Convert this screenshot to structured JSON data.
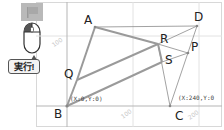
{
  "controls": {
    "flag_icon": "flag-icon",
    "mouse_icon": "mouse-icon",
    "run_label": "実行!"
  },
  "axes": {
    "origin_label": "(X:0,Y:0)",
    "c_label": "(X:240,Y:0",
    "tick_100_y": "100",
    "tick_100_x": "100",
    "tick_200_x": "200"
  },
  "points": {
    "A": "A",
    "B": "B",
    "C": "C",
    "D": "D",
    "P": "P",
    "Q": "Q",
    "R": "R",
    "S": "S"
  },
  "colors": {
    "thick_line": "#9a9a9a",
    "thin_line": "#8a8a8a",
    "grid": "#e2e2e2",
    "axis": "#b5b5b5"
  }
}
